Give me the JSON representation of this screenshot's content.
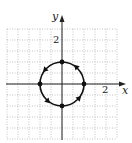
{
  "chart_data": {
    "type": "line",
    "title": "",
    "xlabel": "x",
    "ylabel": "y",
    "xlim": [
      -5,
      5
    ],
    "ylim": [
      -5,
      5
    ],
    "grid": true,
    "grid_style": "dotted",
    "x_tick_labels": [
      {
        "value": 2,
        "label": "2"
      }
    ],
    "y_tick_labels": [
      {
        "value": 2,
        "label": "2"
      }
    ],
    "series": [
      {
        "name": "circle x^2 + y^2 = 4",
        "shape": "circle",
        "center": [
          0,
          0
        ],
        "radius": 2,
        "direction": "counterclockwise",
        "marked_points": [
          [
            2,
            0
          ],
          [
            0,
            2
          ],
          [
            -2,
            0
          ],
          [
            0,
            -2
          ]
        ]
      }
    ]
  },
  "axes": {
    "x_label": "x",
    "y_label": "y",
    "x_tick": "2",
    "y_tick": "2"
  },
  "colors": {
    "curve": "#111111",
    "axis": "#222222",
    "grid": "#9a9a9a"
  }
}
